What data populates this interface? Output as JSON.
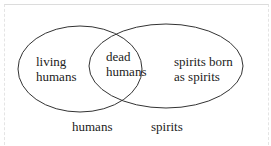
{
  "diagram": {
    "type": "venn",
    "sets": [
      {
        "name": "humans",
        "label": "humans"
      },
      {
        "name": "spirits",
        "label": "spirits"
      }
    ],
    "regions": {
      "left_only": "living\nhumans",
      "intersection": "dead\nhumans",
      "right_only": "spirits born\nas spirits"
    }
  }
}
